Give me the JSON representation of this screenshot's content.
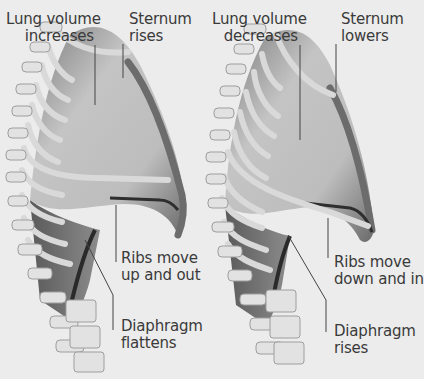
{
  "colors": {
    "background": "#ececec",
    "text": "#3a3a3a",
    "leader_line": "#444444",
    "bone": "#e4e4e4",
    "bone_shadow": "#9a9a9a",
    "lung_light": "#c9c9c9",
    "lung_dark": "#6f6f6f",
    "diaphragm_dark": "#2e2e2e"
  },
  "panels": [
    {
      "state": "inhalation",
      "labels": {
        "lung_volume": [
          "Lung volume",
          "increases"
        ],
        "sternum": [
          "Sternum",
          "rises"
        ],
        "ribs": [
          "Ribs move",
          "up and out"
        ],
        "diaphragm": [
          "Diaphragm",
          "flattens"
        ]
      }
    },
    {
      "state": "exhalation",
      "labels": {
        "lung_volume": [
          "Lung volume",
          "decreases"
        ],
        "sternum": [
          "Sternum",
          "lowers"
        ],
        "ribs": [
          "Ribs move",
          "down and in"
        ],
        "diaphragm": [
          "Diaphragm",
          "rises"
        ]
      }
    }
  ]
}
